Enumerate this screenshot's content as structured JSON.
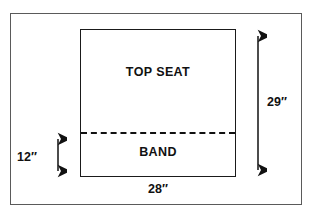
{
  "figure": {
    "outer_frame": "figure-border",
    "regions": [
      {
        "id": "top-seat",
        "label": "TOP SEAT"
      },
      {
        "id": "band",
        "label": "BAND"
      }
    ],
    "divider": {
      "style": "dashed",
      "name": "seat-band-divider"
    },
    "dimensions": [
      {
        "id": "height-total",
        "label": "29″",
        "orientation": "vertical",
        "side": "right"
      },
      {
        "id": "height-band",
        "label": "12″",
        "orientation": "vertical",
        "side": "left"
      },
      {
        "id": "width-total",
        "label": "28″",
        "orientation": "horizontal",
        "side": "bottom"
      }
    ],
    "caption_fragment": "",
    "colors": {
      "rect_stroke": "#1a1a1a",
      "frame_stroke": "#5a5a5a",
      "dash_stroke": "#111111",
      "text": "#111111",
      "background": "#ffffff"
    }
  }
}
